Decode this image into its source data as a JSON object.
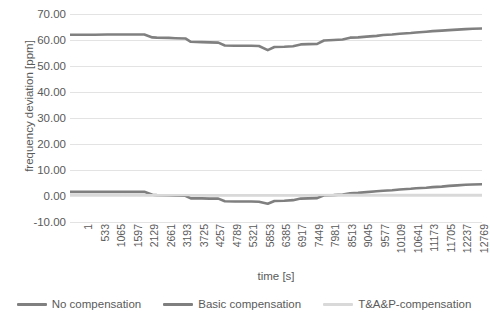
{
  "chart_data": {
    "type": "line",
    "title": "",
    "xlabel": "time [s]",
    "ylabel": "frequency deviation [ppm]",
    "ylim": [
      -10,
      70
    ],
    "yticks": [
      "70.00",
      "60.00",
      "50.00",
      "40.00",
      "30.00",
      "20.00",
      "10.00",
      "0.00",
      "-10.00"
    ],
    "ytick_values": [
      70,
      60,
      50,
      40,
      30,
      20,
      10,
      0,
      -10
    ],
    "grid": "horizontal",
    "legend_position": "bottom",
    "xtick_labels": [
      "1",
      "533",
      "1065",
      "1597",
      "2129",
      "2661",
      "3193",
      "3725",
      "4257",
      "4789",
      "5321",
      "5853",
      "6385",
      "6917",
      "7449",
      "7981",
      "8513",
      "9045",
      "9577",
      "10109",
      "10641",
      "11173",
      "11705",
      "12237",
      "12769"
    ],
    "xlim": [
      1,
      13301
    ],
    "colors": {
      "no_compensation": "#808080",
      "basic_compensation": "#7f7f7f",
      "ta_p_compensation": "#d9d9d9",
      "gridline": "#e3e3e3",
      "text": "#5a5a5a"
    },
    "series": [
      {
        "name": "No compensation",
        "color": "#808080",
        "x": [
          1,
          400,
          800,
          1200,
          1600,
          2000,
          2400,
          2660,
          2800,
          3193,
          3400,
          3725,
          3900,
          4257,
          4500,
          4789,
          5000,
          5321,
          5600,
          5853,
          6100,
          6385,
          6600,
          6917,
          7200,
          7449,
          7700,
          7981,
          8200,
          8513,
          8800,
          9045,
          9300,
          9577,
          9900,
          10109,
          10400,
          10641,
          11000,
          11173,
          11500,
          11705,
          12000,
          12237,
          12500,
          12769,
          13000,
          13301
        ],
        "y": [
          62.0,
          62.0,
          62.0,
          62.1,
          62.1,
          62.1,
          62.1,
          61.0,
          60.9,
          60.8,
          60.7,
          60.6,
          59.3,
          59.2,
          59.1,
          59.0,
          57.9,
          57.8,
          57.8,
          57.8,
          57.7,
          56.1,
          57.3,
          57.4,
          57.6,
          58.3,
          58.4,
          58.5,
          59.8,
          60.0,
          60.2,
          60.9,
          61.0,
          61.3,
          61.6,
          61.9,
          62.1,
          62.4,
          62.7,
          62.9,
          63.2,
          63.4,
          63.6,
          63.8,
          64.0,
          64.2,
          64.3,
          64.4
        ]
      },
      {
        "name": "Basic compensation",
        "color": "#7f7f7f",
        "x": [
          1,
          400,
          800,
          1200,
          1600,
          2000,
          2400,
          2660,
          2800,
          3193,
          3400,
          3725,
          3900,
          4257,
          4500,
          4789,
          5000,
          5321,
          5600,
          5853,
          6100,
          6385,
          6600,
          6917,
          7200,
          7449,
          7700,
          7981,
          8200,
          8513,
          8800,
          9045,
          9300,
          9577,
          9900,
          10109,
          10400,
          10641,
          11000,
          11173,
          11500,
          11705,
          12000,
          12237,
          12500,
          12769,
          13000,
          13301
        ],
        "y": [
          1.6,
          1.6,
          1.6,
          1.6,
          1.6,
          1.6,
          1.6,
          0.5,
          0.4,
          0.3,
          0.2,
          0.1,
          -0.9,
          -0.9,
          -1.0,
          -1.0,
          -2.0,
          -2.1,
          -2.1,
          -2.1,
          -2.2,
          -3.0,
          -1.9,
          -1.8,
          -1.6,
          -1.0,
          -0.9,
          -0.8,
          0.3,
          0.4,
          0.6,
          1.0,
          1.2,
          1.5,
          1.8,
          2.0,
          2.2,
          2.5,
          2.8,
          3.0,
          3.2,
          3.4,
          3.6,
          3.9,
          4.1,
          4.3,
          4.4,
          4.5
        ]
      },
      {
        "name": "T&A&P-compensation",
        "color": "#d9d9d9",
        "x": [
          1,
          1500,
          3000,
          4500,
          6000,
          7500,
          9000,
          10500,
          12000,
          13301
        ],
        "y": [
          0.4,
          0.4,
          0.3,
          0.3,
          0.3,
          0.3,
          0.4,
          0.4,
          0.4,
          0.4
        ]
      }
    ]
  },
  "legend": {
    "items": [
      {
        "label": "No compensation"
      },
      {
        "label": "Basic compensation"
      },
      {
        "label": "T&A&P-compensation"
      }
    ]
  }
}
